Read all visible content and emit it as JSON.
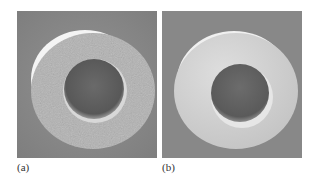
{
  "figure": {
    "panels": [
      {
        "id": "a",
        "label": "(a)",
        "description": "Hollow cylindrical tube cross-section with rough porous surface"
      },
      {
        "id": "b",
        "label": "(b)",
        "description": "Hollow cylindrical tube cross-section with smooth surface"
      }
    ],
    "colors": {
      "background": "#8a8a8a",
      "tube_face_a": "#b3b3b3",
      "tube_face_b": "#d4d4d4",
      "bore": "#5f5f5f",
      "rim_highlight": "#f2f2f2"
    }
  }
}
